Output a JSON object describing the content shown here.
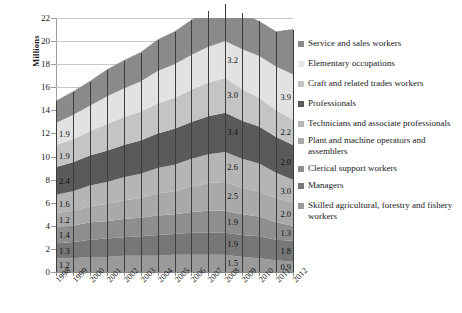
{
  "chart_data": {
    "type": "area",
    "title": "",
    "xlabel": "",
    "ylabel": "Millions",
    "ylim": [
      0,
      22
    ],
    "ytick_step": 2,
    "grid": true,
    "legend_position": "right",
    "categories": [
      "1998",
      "1999",
      "2000",
      "2001",
      "2002",
      "2003",
      "2004",
      "2005",
      "2006",
      "2007",
      "2008",
      "2009",
      "2010",
      "2011",
      "2012"
    ],
    "series": [
      {
        "name": "Skilled agricultural, forestry and fishery workers",
        "color": "#9a9a9a",
        "values": [
          1.2,
          1.2,
          1.3,
          1.3,
          1.4,
          1.4,
          1.4,
          1.5,
          1.5,
          1.5,
          1.5,
          1.3,
          1.2,
          1.0,
          0.9
        ]
      },
      {
        "name": "Managers",
        "color": "#777777",
        "values": [
          1.3,
          1.4,
          1.5,
          1.6,
          1.6,
          1.7,
          1.8,
          1.8,
          1.9,
          1.9,
          1.9,
          1.9,
          1.9,
          1.8,
          1.8
        ]
      },
      {
        "name": "Clerical support workers",
        "color": "#8e8e8e",
        "values": [
          1.4,
          1.4,
          1.5,
          1.5,
          1.6,
          1.6,
          1.7,
          1.7,
          1.8,
          1.9,
          1.9,
          1.8,
          1.7,
          1.5,
          1.3
        ]
      },
      {
        "name": "Plant and machine operators and assemblers",
        "color": "#a9a9a9",
        "values": [
          1.2,
          1.3,
          1.4,
          1.5,
          1.6,
          1.7,
          1.9,
          2.0,
          2.2,
          2.4,
          2.5,
          2.3,
          2.2,
          2.1,
          2.0
        ]
      },
      {
        "name": "Technicians and associate professionals",
        "color": "#b5b5b5",
        "values": [
          1.6,
          1.7,
          1.8,
          1.9,
          2.0,
          2.1,
          2.2,
          2.3,
          2.4,
          2.5,
          2.6,
          2.5,
          2.4,
          2.2,
          2.0
        ]
      },
      {
        "name": "Professionals",
        "color": "#5a5a5a",
        "values": [
          2.4,
          2.5,
          2.6,
          2.7,
          2.8,
          2.9,
          3.0,
          3.1,
          3.2,
          3.3,
          3.4,
          3.3,
          3.2,
          3.1,
          3.0
        ]
      },
      {
        "name": "Craft and related trades workers",
        "color": "#c4c4c4",
        "values": [
          1.9,
          2.0,
          2.1,
          2.3,
          2.4,
          2.5,
          2.6,
          2.7,
          2.8,
          2.9,
          3.0,
          2.7,
          2.5,
          2.3,
          2.2
        ]
      },
      {
        "name": "Elementary occupations",
        "color": "#e2e2e2",
        "values": [
          1.9,
          2.1,
          2.2,
          2.4,
          2.5,
          2.6,
          2.8,
          2.9,
          3.0,
          3.1,
          3.2,
          3.5,
          3.6,
          3.8,
          3.9
        ]
      },
      {
        "name": "Service and sales workers",
        "color": "#8a8a8a",
        "values": [
          1.9,
          2.0,
          2.1,
          2.3,
          2.4,
          2.5,
          2.7,
          2.8,
          3.0,
          3.1,
          3.2,
          3.1,
          3.0,
          3.0,
          3.9
        ]
      }
    ],
    "ytick_labels": [
      "0",
      "2",
      "4",
      "6",
      "8",
      "10",
      "12",
      "14",
      "16",
      "18",
      "20",
      "22"
    ],
    "data_labels_left": [
      "1.2",
      "1.3",
      "1.4",
      "1.2",
      "1.6",
      "2.4",
      "1.9",
      "1.9"
    ],
    "data_labels_center": [
      "1.5",
      "1.9",
      "1.9",
      "2.5",
      "2.6",
      "3.4",
      "3.0",
      "3.2"
    ],
    "data_labels_right": [
      "0.9",
      "1.8",
      "1.3",
      "2.0",
      "3.0",
      "2.0",
      "2.2",
      "3.9"
    ]
  },
  "legend": {
    "items": [
      {
        "label": "Service and sales workers",
        "color": "#8a8a8a"
      },
      {
        "label": "Elementary occupations",
        "color": "#e8e8e8"
      },
      {
        "label": "Craft and related trades workers",
        "color": "#c4c4c4"
      },
      {
        "label": "Professionals",
        "color": "#5a5a5a"
      },
      {
        "label": "Technicians and associate professionals",
        "color": "#b5b5b5"
      },
      {
        "label": "Plant and machine operators and assemblers",
        "color": "#a9a9a9"
      },
      {
        "label": "Clerical support workers",
        "color": "#8e8e8e"
      },
      {
        "label": "Managers",
        "color": "#777777"
      },
      {
        "label": "Skilled agricultural, forestry and fishery workers",
        "color": "#9a9a9a"
      }
    ]
  }
}
